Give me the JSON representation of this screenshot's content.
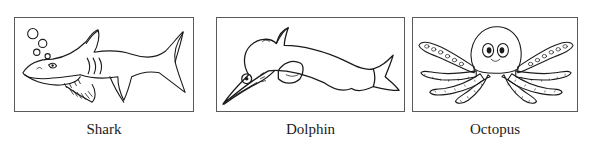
{
  "page": {
    "background_color": "#ffffff",
    "ink_color": "#1a1a1a",
    "border_color": "#5a5a5a",
    "layout": "three line-art illustration panels in a row with captions beneath"
  },
  "panels": [
    {
      "id": "shark",
      "caption": "Shark",
      "icon_name": "shark-line-drawing",
      "alt": "Black and white outline drawing of a shark facing left with bubbles, gill slits, teeth and a crescent tail",
      "features": [
        "bubbles",
        "eye",
        "snout",
        "teeth",
        "gill-slits",
        "dorsal-fin",
        "pectoral-fin",
        "caudal-fin"
      ]
    },
    {
      "id": "dolphin",
      "caption": "Dolphin",
      "icon_name": "dolphin-line-drawing",
      "alt": "Black and white outline drawing of a leaping dolphin facing left with a long beak, round eye, pectoral fin and notched fluke",
      "features": [
        "eye",
        "beak",
        "melon",
        "dorsal-fin",
        "pectoral-fin",
        "fluke"
      ]
    },
    {
      "id": "octopus",
      "caption": "Octopus",
      "icon_name": "octopus-line-drawing",
      "alt": "Black and white outline drawing of an octopus with a bulbous mantle, two large eyes and eight tentacles with suckers",
      "features": [
        "mantle",
        "eyes",
        "tentacles",
        "suckers"
      ]
    }
  ]
}
